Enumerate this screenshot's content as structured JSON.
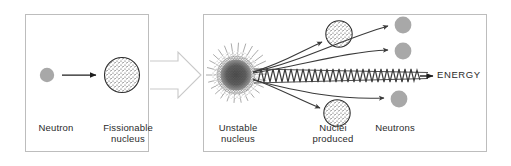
{
  "figure": {
    "width": 511,
    "height": 166,
    "background_color": "#ffffff"
  },
  "colors": {
    "panel_border": "#bdbdbd",
    "text": "#2b2b2b",
    "stroke_dark": "#3a3a3a",
    "neutron_fill": "#a8a8a8",
    "nucleus_speckle": "#4a4a4a",
    "block_arrow_outline": "#c9c9c9",
    "wave_stroke": "#3a3a3a"
  },
  "panels": {
    "left": {
      "name": "before-fission",
      "labels": {
        "neutron": "Neutron",
        "fissionable_nucleus": "Fissionable\nnucleus"
      }
    },
    "right": {
      "name": "after-fission",
      "labels": {
        "unstable_nucleus": "Unstable\nnucleus",
        "nuclei_produced": "Nuclei\nproduced",
        "neutrons": "Neutrons",
        "energy": "ENERGY"
      }
    }
  },
  "icons": {
    "incoming_neutron": "neutron-particle-icon",
    "fissionable_nucleus": "speckled-nucleus-icon",
    "process_arrow": "block-arrow-right-icon",
    "unstable_nucleus": "radiating-unstable-nucleus-icon",
    "emitted_nucleus": "speckled-nucleus-icon",
    "emitted_neutron": "neutron-particle-icon",
    "energy_wave": "zigzag-wave-icon",
    "motion_arrow": "curved-arrow-icon"
  },
  "counts": {
    "emitted_nuclei": 2,
    "emitted_neutrons": 3,
    "energy_waves": 1
  }
}
